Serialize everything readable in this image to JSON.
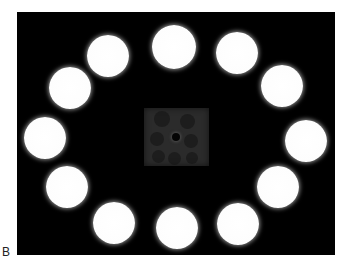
{
  "figure": {
    "panel_label": "B",
    "background_color": "#000000",
    "well_color": "#ffffff",
    "center_sample_color": "#2b2b2b",
    "wells": [
      {
        "cx": 174,
        "cy": 47,
        "r": 22
      },
      {
        "cx": 237,
        "cy": 53,
        "r": 21
      },
      {
        "cx": 282,
        "cy": 86,
        "r": 21
      },
      {
        "cx": 306,
        "cy": 141,
        "r": 21
      },
      {
        "cx": 278,
        "cy": 187,
        "r": 21
      },
      {
        "cx": 238,
        "cy": 224,
        "r": 21
      },
      {
        "cx": 177,
        "cy": 228,
        "r": 21
      },
      {
        "cx": 114,
        "cy": 223,
        "r": 21
      },
      {
        "cx": 67,
        "cy": 187,
        "r": 21
      },
      {
        "cx": 45,
        "cy": 138,
        "r": 21
      },
      {
        "cx": 70,
        "cy": 88,
        "r": 21
      },
      {
        "cx": 108,
        "cy": 56,
        "r": 21
      }
    ],
    "center_sample": {
      "x": 144,
      "y": 108,
      "w": 65,
      "h": 58
    },
    "center_dot": {
      "cx": 176,
      "cy": 137,
      "r": 4
    }
  }
}
